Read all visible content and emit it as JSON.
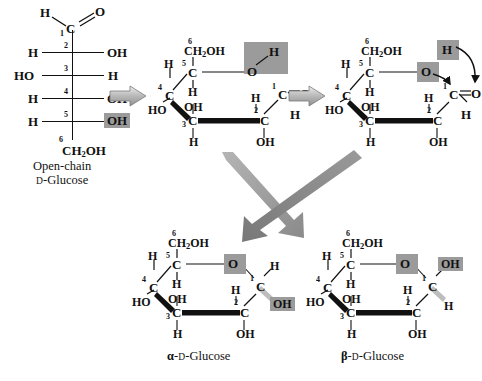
{
  "figure": {
    "type": "chemical-reaction-scheme",
    "background": "#ffffff",
    "highlight_color": "#9b9b9b",
    "arrow_color": "#8c8c8c"
  },
  "structures": {
    "open_chain": {
      "name": "Open-chain D-Glucose",
      "caption_line1": "Open-chain",
      "caption_line2_prefix": "D",
      "caption_line2_suffix": "-Glucose",
      "carbons": [
        {
          "n": "1",
          "label": "C",
          "left": "H",
          "right": "O",
          "bond": "double"
        },
        {
          "n": "2",
          "label": "",
          "left": "H",
          "right": "OH"
        },
        {
          "n": "3",
          "label": "",
          "left": "HO",
          "right": "H"
        },
        {
          "n": "4",
          "label": "",
          "left": "H",
          "right": "OH"
        },
        {
          "n": "5",
          "label": "",
          "left": "H",
          "right": "OH",
          "highlight": true
        },
        {
          "n": "6",
          "label": "CH2OH"
        }
      ]
    },
    "open_ring": {
      "name": "coiled open-chain intermediate",
      "c6": "CH2OH",
      "c5": "C",
      "c4": "C",
      "c3": "C",
      "c2": "C",
      "c1": "C",
      "o_ring": "O",
      "o_h": "H",
      "c1_carbonyl_o": "O",
      "c1_h": "H",
      "c2_oh": "OH",
      "c2_h": "H",
      "c3_h": "H",
      "c3_oh": "OH",
      "c4_h": "H",
      "c4_ho": "HO",
      "c5_h": "H",
      "highlights": [
        "o_ring",
        "o_h"
      ]
    },
    "attack": {
      "name": "nucleophilic attack intermediate",
      "c6": "CH2OH",
      "o_ring": "O",
      "o_h": "H",
      "c1_carbonyl_o": "O",
      "c1_h": "H",
      "c2_oh": "OH",
      "c2_h": "H",
      "c3_h": "H",
      "c3_oh": "OH",
      "c4_ho": "HO",
      "c4_h": "H",
      "c5_h": "H",
      "arrows": [
        "O-to-C1",
        "H-to-O"
      ],
      "highlights": [
        "o_ring",
        "o_h"
      ]
    },
    "alpha": {
      "name": "alpha-D-Glucose",
      "caption_alpha": "α",
      "caption_mid": "-",
      "caption_d": "D",
      "caption_rest": "-Glucose",
      "c6": "CH2OH",
      "o_ring": "O",
      "c1_h": "H",
      "c1_oh": "OH",
      "c2_oh": "OH",
      "c2_h": "H",
      "c3_h": "H",
      "c3_oh": "OH",
      "c4_ho": "HO",
      "c4_h": "H",
      "c5_h": "H",
      "highlights": [
        "o_ring",
        "c1_oh"
      ],
      "anomeric_oh_position": "down"
    },
    "beta": {
      "name": "beta-D-Glucose",
      "caption_beta": "β",
      "caption_mid": "-",
      "caption_d": "D",
      "caption_rest": "-Glucose",
      "c6": "CH2OH",
      "o_ring": "O",
      "c1_oh": "OH",
      "c1_h": "H",
      "c2_oh": "OH",
      "c2_h": "H",
      "c3_h": "H",
      "c3_oh": "OH",
      "c4_ho": "HO",
      "c4_h": "H",
      "c5_h": "H",
      "highlights": [
        "o_ring",
        "c1_oh"
      ],
      "anomeric_oh_position": "up"
    }
  },
  "arrows": {
    "step1": "block-arrow-right",
    "step2": "block-arrow-right",
    "to_alpha": "block-arrow-diagonal-down-left",
    "to_beta": "block-arrow-diagonal-down-right"
  },
  "atoms": {
    "C": "C",
    "H": "H",
    "O": "O",
    "OH": "OH",
    "HO": "HO",
    "CH": "CH",
    "two": "2",
    "OHtail": "OH"
  },
  "numbers": {
    "n1": "1",
    "n2": "2",
    "n3": "3",
    "n4": "4",
    "n5": "5",
    "n6": "6"
  }
}
